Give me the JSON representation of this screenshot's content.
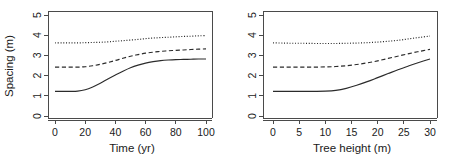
{
  "chart_data": [
    {
      "panel": "left",
      "type": "line",
      "title": "",
      "xlabel": "Time (yr)",
      "ylabel": "Spacing (m)",
      "xlim": [
        0,
        100
      ],
      "ylim": [
        0,
        5
      ],
      "xticks": [
        0,
        20,
        40,
        60,
        80,
        100
      ],
      "xticklabels": [
        "0",
        "20",
        "40",
        "60",
        "80",
        "100"
      ],
      "yticks": [
        0,
        1,
        2,
        3,
        4,
        5
      ],
      "yticklabels": [
        "0",
        "1",
        "2",
        "3",
        "4",
        "5"
      ],
      "grid": false,
      "legend": "none",
      "x": [
        0,
        5,
        10,
        15,
        20,
        25,
        30,
        35,
        40,
        45,
        50,
        55,
        60,
        65,
        70,
        75,
        80,
        85,
        90,
        95,
        100
      ],
      "series": [
        {
          "name": "upper",
          "linestyle": "dotted",
          "values": [
            3.62,
            3.62,
            3.62,
            3.62,
            3.63,
            3.64,
            3.65,
            3.67,
            3.7,
            3.73,
            3.76,
            3.79,
            3.83,
            3.86,
            3.88,
            3.9,
            3.92,
            3.94,
            3.95,
            3.97,
            3.98
          ]
        },
        {
          "name": "middle",
          "linestyle": "dashed",
          "values": [
            2.42,
            2.42,
            2.42,
            2.42,
            2.44,
            2.49,
            2.56,
            2.65,
            2.75,
            2.86,
            2.96,
            3.04,
            3.11,
            3.16,
            3.2,
            3.23,
            3.25,
            3.27,
            3.29,
            3.31,
            3.32
          ]
        },
        {
          "name": "lower",
          "linestyle": "solid",
          "values": [
            1.22,
            1.22,
            1.22,
            1.23,
            1.3,
            1.44,
            1.62,
            1.83,
            2.03,
            2.22,
            2.39,
            2.52,
            2.62,
            2.69,
            2.74,
            2.77,
            2.79,
            2.8,
            2.81,
            2.82,
            2.82
          ]
        }
      ]
    },
    {
      "panel": "right",
      "type": "line",
      "title": "",
      "xlabel": "Tree height (m)",
      "ylabel": "",
      "xlim": [
        0,
        30
      ],
      "ylim": [
        0,
        5
      ],
      "xticks": [
        0,
        5,
        10,
        15,
        20,
        25,
        30
      ],
      "xticklabels": [
        "0",
        "5",
        "10",
        "15",
        "20",
        "25",
        "30"
      ],
      "yticks": [
        0,
        1,
        2,
        3,
        4,
        5
      ],
      "yticklabels": [
        "0",
        "1",
        "2",
        "3",
        "4",
        "5"
      ],
      "grid": false,
      "legend": "none",
      "x": [
        0,
        2,
        4,
        6,
        8,
        10,
        12,
        14,
        16,
        18,
        20,
        22,
        24,
        26,
        28,
        30
      ],
      "series": [
        {
          "name": "upper",
          "linestyle": "dotted",
          "values": [
            3.62,
            3.61,
            3.6,
            3.6,
            3.59,
            3.59,
            3.59,
            3.6,
            3.61,
            3.63,
            3.66,
            3.7,
            3.75,
            3.82,
            3.89,
            3.96
          ]
        },
        {
          "name": "middle",
          "linestyle": "dashed",
          "values": [
            2.42,
            2.42,
            2.42,
            2.42,
            2.42,
            2.43,
            2.45,
            2.49,
            2.55,
            2.63,
            2.73,
            2.85,
            2.97,
            3.09,
            3.2,
            3.3
          ]
        },
        {
          "name": "lower",
          "linestyle": "solid",
          "values": [
            1.22,
            1.22,
            1.22,
            1.22,
            1.22,
            1.23,
            1.27,
            1.37,
            1.52,
            1.7,
            1.9,
            2.1,
            2.3,
            2.49,
            2.66,
            2.82
          ]
        }
      ]
    }
  ],
  "figure": {
    "panels": [
      {
        "id": "panel-left",
        "xlabel": "Time (yr)",
        "ylabel": "Spacing (m)",
        "xticklabels": [
          "0",
          "20",
          "40",
          "60",
          "80",
          "100"
        ],
        "yticklabels": [
          "0",
          "1",
          "2",
          "3",
          "4",
          "5"
        ]
      },
      {
        "id": "panel-right",
        "xlabel": "Tree height (m)",
        "ylabel": "",
        "xticklabels": [
          "0",
          "5",
          "10",
          "15",
          "20",
          "25",
          "30"
        ],
        "yticklabels": [
          "0",
          "1",
          "2",
          "3",
          "4",
          "5"
        ]
      }
    ],
    "colors": {
      "axis": "#4a4a4a",
      "curve": "#2b2b2b",
      "background": "#ffffff"
    }
  }
}
